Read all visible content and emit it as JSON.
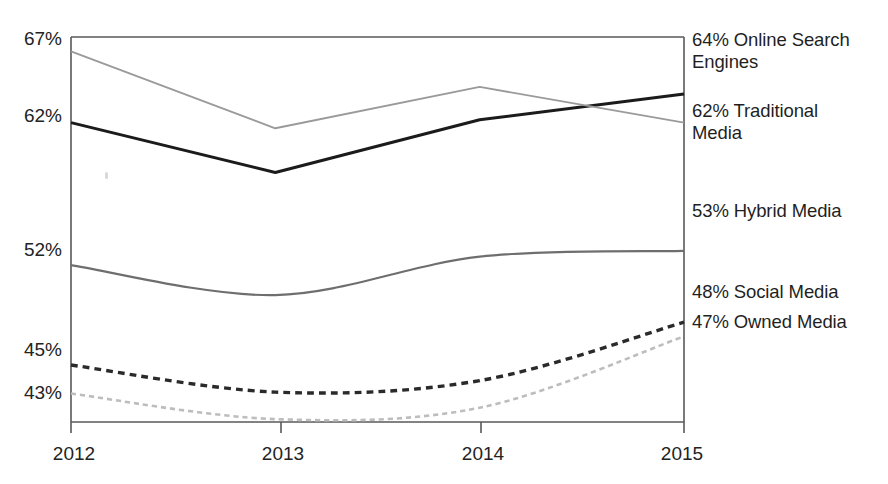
{
  "chart_data": {
    "type": "line",
    "title": "",
    "subtitle": "",
    "xlabel": "",
    "ylabel": "",
    "categories": [
      "2012",
      "2013",
      "2014",
      "2015"
    ],
    "x": [
      2012,
      2013,
      2014,
      2015
    ],
    "ylim": [
      41,
      68
    ],
    "xlim": [
      2012,
      2015
    ],
    "grid": false,
    "legend_position": "right-end-labels",
    "y_tick_labels": [
      "67%",
      "62%",
      "52%",
      "45%",
      "43%"
    ],
    "y_tick_values": [
      67,
      62,
      52,
      45,
      43
    ],
    "x_tick_labels": [
      "2012",
      "2013",
      "2014",
      "2015"
    ],
    "series": [
      {
        "name": "Online Search Engines",
        "end_label": "64% Online Search Engines",
        "end_value": 64,
        "values": [
          62,
          58.5,
          62.2,
          64
        ],
        "style": "solid",
        "color": "#1b1b1b",
        "width": 3.0,
        "curve": "linear"
      },
      {
        "name": "Traditional Media",
        "end_label": "62% Traditional Media",
        "end_value": 62,
        "values": [
          67,
          61.6,
          64.5,
          62
        ],
        "style": "solid",
        "color": "#9a9a9a",
        "width": 1.9,
        "curve": "linear"
      },
      {
        "name": "Hybrid Media",
        "end_label": "53% Hybrid Media",
        "end_value": 53,
        "values": [
          52,
          49.9,
          52.6,
          53
        ],
        "style": "solid",
        "color": "#6e6e6e",
        "width": 2.1,
        "curve": "smooth"
      },
      {
        "name": "Social Media",
        "end_label": "48% Social Media",
        "end_value": 48,
        "values": [
          45,
          43.1,
          43.9,
          48
        ],
        "style": "dashed",
        "color": "#2a2a2a",
        "width": 3.4,
        "curve": "smooth"
      },
      {
        "name": "Owned Media",
        "end_label": "47% Owned Media",
        "end_value": 47,
        "values": [
          43,
          41.2,
          42.0,
          47
        ],
        "style": "dashed",
        "color": "#bdbdbd",
        "width": 2.6,
        "curve": "smooth"
      }
    ],
    "annotations": []
  },
  "labels": {
    "online_search_engines": "64% Online Search\nEngines",
    "traditional_media": "62% Traditional\nMedia",
    "hybrid_media": "53% Hybrid Media",
    "social_media": "48% Social Media",
    "owned_media": "47% Owned Media"
  },
  "axis": {
    "y": {
      "t0": "67%",
      "t1": "62%",
      "t2": "52%",
      "t3": "45%",
      "t4": "43%"
    },
    "x": {
      "t0": "2012",
      "t1": "2013",
      "t2": "2014",
      "t3": "2015"
    }
  },
  "caption": {
    "text": ""
  }
}
